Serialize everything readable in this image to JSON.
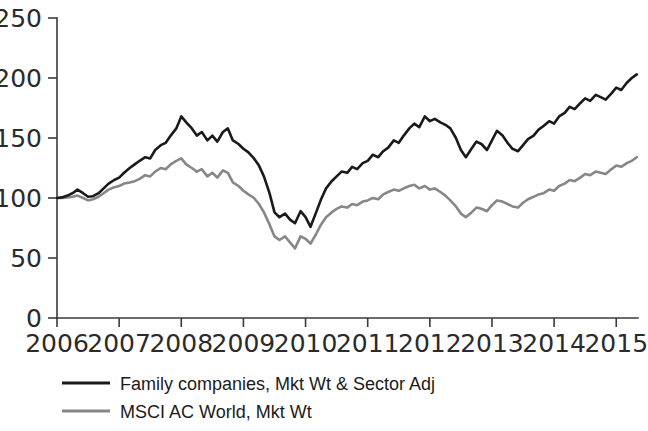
{
  "chart_data": {
    "type": "line",
    "title": "",
    "xlabel": "",
    "ylabel": "",
    "xlim": [
      2006,
      2015.35
    ],
    "ylim": [
      0,
      250
    ],
    "grid": false,
    "legend_position": "bottom-left",
    "yticks": [
      "0",
      "50",
      "100",
      "150",
      "200",
      "250"
    ],
    "xticks": [
      "2006",
      "2007",
      "2008",
      "2009",
      "2010",
      "2011",
      "2012",
      "2013",
      "2014",
      "2015"
    ],
    "series": [
      {
        "name": "Family companies, Mkt Wt & Sector Adj",
        "color": "#1a1a1a",
        "width": 2.6,
        "x": [
          2006.0,
          2006.08,
          2006.17,
          2006.25,
          2006.33,
          2006.42,
          2006.5,
          2006.58,
          2006.67,
          2006.75,
          2006.83,
          2006.92,
          2007.0,
          2007.08,
          2007.17,
          2007.25,
          2007.33,
          2007.42,
          2007.5,
          2007.58,
          2007.67,
          2007.75,
          2007.83,
          2007.92,
          2008.0,
          2008.08,
          2008.17,
          2008.25,
          2008.33,
          2008.42,
          2008.5,
          2008.58,
          2008.67,
          2008.75,
          2008.83,
          2008.92,
          2009.0,
          2009.08,
          2009.17,
          2009.25,
          2009.33,
          2009.42,
          2009.5,
          2009.58,
          2009.67,
          2009.75,
          2009.83,
          2009.92,
          2010.0,
          2010.08,
          2010.17,
          2010.25,
          2010.33,
          2010.42,
          2010.5,
          2010.58,
          2010.67,
          2010.75,
          2010.83,
          2010.92,
          2011.0,
          2011.08,
          2011.17,
          2011.25,
          2011.33,
          2011.42,
          2011.5,
          2011.58,
          2011.67,
          2011.75,
          2011.83,
          2011.92,
          2012.0,
          2012.08,
          2012.17,
          2012.25,
          2012.33,
          2012.42,
          2012.5,
          2012.58,
          2012.67,
          2012.75,
          2012.83,
          2012.92,
          2013.0,
          2013.08,
          2013.17,
          2013.25,
          2013.33,
          2013.42,
          2013.5,
          2013.58,
          2013.67,
          2013.75,
          2013.83,
          2013.92,
          2014.0,
          2014.08,
          2014.17,
          2014.25,
          2014.33,
          2014.42,
          2014.5,
          2014.58,
          2014.67,
          2014.75,
          2014.83,
          2014.92,
          2015.0,
          2015.08,
          2015.17,
          2015.25,
          2015.33
        ],
        "values": [
          100,
          100.5,
          102,
          104,
          107,
          104,
          101,
          101.5,
          104,
          108,
          112,
          115,
          117,
          121,
          125,
          128,
          131,
          134,
          133,
          140,
          144,
          146,
          152,
          158,
          168,
          163,
          158,
          152,
          155,
          148,
          152,
          147,
          155,
          158,
          148,
          145,
          141,
          138,
          133,
          127,
          118,
          104,
          88,
          84,
          87,
          82,
          79,
          89,
          84,
          76,
          88,
          99,
          108,
          114,
          118,
          122,
          121,
          126,
          124,
          129,
          131,
          136,
          134,
          139,
          142,
          148,
          146,
          152,
          158,
          162,
          159,
          168,
          164,
          166,
          163,
          161,
          158,
          150,
          140,
          134,
          141,
          147,
          145,
          140,
          148,
          156,
          152,
          146,
          141,
          139,
          144,
          149,
          152,
          157,
          160,
          164,
          162,
          168,
          171,
          176,
          174,
          179,
          183,
          181,
          186,
          184,
          182,
          187,
          192,
          190,
          196,
          200,
          203
        ]
      },
      {
        "name": "MSCI AC World, Mkt Wt",
        "color": "#878787",
        "width": 2.6,
        "x": [
          2006.0,
          2006.08,
          2006.17,
          2006.25,
          2006.33,
          2006.42,
          2006.5,
          2006.58,
          2006.67,
          2006.75,
          2006.83,
          2006.92,
          2007.0,
          2007.08,
          2007.17,
          2007.25,
          2007.33,
          2007.42,
          2007.5,
          2007.58,
          2007.67,
          2007.75,
          2007.83,
          2007.92,
          2008.0,
          2008.08,
          2008.17,
          2008.25,
          2008.33,
          2008.42,
          2008.5,
          2008.58,
          2008.67,
          2008.75,
          2008.83,
          2008.92,
          2009.0,
          2009.08,
          2009.17,
          2009.25,
          2009.33,
          2009.42,
          2009.5,
          2009.58,
          2009.67,
          2009.75,
          2009.83,
          2009.92,
          2010.0,
          2010.08,
          2010.17,
          2010.25,
          2010.33,
          2010.42,
          2010.5,
          2010.58,
          2010.67,
          2010.75,
          2010.83,
          2010.92,
          2011.0,
          2011.08,
          2011.17,
          2011.25,
          2011.33,
          2011.42,
          2011.5,
          2011.58,
          2011.67,
          2011.75,
          2011.83,
          2011.92,
          2012.0,
          2012.08,
          2012.17,
          2012.25,
          2012.33,
          2012.42,
          2012.5,
          2012.58,
          2012.67,
          2012.75,
          2012.83,
          2012.92,
          2013.0,
          2013.08,
          2013.17,
          2013.25,
          2013.33,
          2013.42,
          2013.5,
          2013.58,
          2013.67,
          2013.75,
          2013.83,
          2013.92,
          2014.0,
          2014.08,
          2014.17,
          2014.25,
          2014.33,
          2014.42,
          2014.5,
          2014.58,
          2014.67,
          2014.75,
          2014.83,
          2014.92,
          2015.0,
          2015.08,
          2015.17,
          2015.25,
          2015.33
        ],
        "values": [
          100,
          100,
          100.5,
          101,
          102,
          100,
          98,
          99,
          101,
          104,
          107,
          109,
          110,
          112,
          113,
          114,
          116,
          119,
          118,
          122,
          125,
          124,
          128,
          131,
          133,
          128,
          125,
          122,
          124,
          118,
          121,
          117,
          123,
          121,
          113,
          110,
          106,
          103,
          100,
          95,
          88,
          78,
          68,
          65,
          68,
          63,
          58,
          68,
          66,
          62,
          70,
          78,
          84,
          88,
          91,
          93,
          92,
          95,
          94,
          97,
          98,
          100,
          99,
          103,
          105,
          107,
          106,
          108,
          110,
          111,
          108,
          110,
          107,
          108,
          105,
          102,
          98,
          93,
          87,
          84,
          88,
          92,
          91,
          89,
          94,
          98,
          97,
          95,
          93,
          92,
          96,
          99,
          101,
          103,
          104,
          107,
          106,
          110,
          112,
          115,
          114,
          117,
          120,
          119,
          122,
          121,
          120,
          124,
          127,
          126,
          129,
          131,
          134
        ]
      }
    ]
  },
  "legend": {
    "items": [
      {
        "label": "Family companies, Mkt Wt & Sector Adj",
        "color": "#1a1a1a"
      },
      {
        "label": "MSCI AC World, Mkt Wt",
        "color": "#878787"
      }
    ]
  }
}
